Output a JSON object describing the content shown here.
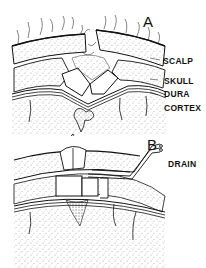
{
  "figure": {
    "panels": [
      {
        "id": "A",
        "letter": "A",
        "labels": {
          "scalp": "SCALP",
          "skull": "SKULL",
          "dura": "DURA",
          "cortex": "CORTEX"
        }
      },
      {
        "id": "B",
        "letter": "B",
        "labels": {
          "drain": "DRAIN"
        }
      }
    ],
    "colors": {
      "ink": "#111111",
      "background": "#ffffff",
      "stipple": "#555555"
    }
  }
}
